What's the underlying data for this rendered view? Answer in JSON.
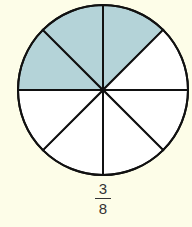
{
  "diagram": {
    "type": "fraction-circle",
    "total_parts": 8,
    "shaded_parts": 3,
    "shaded_color": "#b4d3d8",
    "unshaded_color": "#ffffff",
    "stroke_color": "#111111",
    "background_color": "#fdfde8"
  },
  "label": {
    "numerator": "3",
    "denominator": "8"
  }
}
